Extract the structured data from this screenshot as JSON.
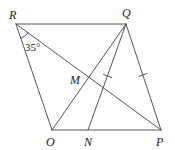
{
  "diagram": {
    "type": "geometry-figure",
    "points": {
      "R": {
        "label": "R",
        "x": 16,
        "y": 24
      },
      "Q": {
        "label": "Q",
        "x": 126,
        "y": 24
      },
      "O": {
        "label": "O",
        "x": 52,
        "y": 130
      },
      "N": {
        "label": "N",
        "x": 88,
        "y": 130
      },
      "P": {
        "label": "P",
        "x": 161,
        "y": 130
      },
      "M": {
        "label": "M",
        "x": 90,
        "y": 72
      }
    },
    "segments": [
      [
        "R",
        "Q"
      ],
      [
        "R",
        "O"
      ],
      [
        "O",
        "P"
      ],
      [
        "Q",
        "P"
      ],
      [
        "R",
        "P"
      ],
      [
        "O",
        "Q"
      ],
      [
        "Q",
        "N"
      ]
    ],
    "equal_marks": [
      [
        "Q",
        "N"
      ],
      [
        "Q",
        "P"
      ]
    ],
    "angle": {
      "vertex": "R",
      "between": [
        "O",
        "P"
      ],
      "label": "35°"
    },
    "line_color": "#555555",
    "text_color": "#222222"
  }
}
